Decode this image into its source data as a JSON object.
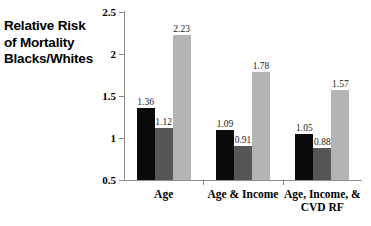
{
  "chart_data": {
    "type": "bar",
    "title": "",
    "ylabel": "Relative Risk of Mortality Blacks/Whites",
    "ylabel_lines": [
      "Relative Risk",
      "of Mortality",
      "Blacks/Whites"
    ],
    "xlabel": "",
    "categories": [
      "Age",
      "Age & Income",
      "Age, Income, & CVD RF"
    ],
    "category_lines": [
      [
        "Age"
      ],
      [
        "Age & Income"
      ],
      [
        "Age, Income, &",
        "CVD RF"
      ]
    ],
    "ylim": [
      0.5,
      2.5
    ],
    "yticks": [
      0.5,
      1,
      1.5,
      2,
      2.5
    ],
    "ytick_labels": [
      "0.5",
      "1",
      "1.5",
      "2",
      "2.5"
    ],
    "grid": false,
    "legend": "none",
    "series": [
      {
        "name": "series-1",
        "color": "#0a0a0a",
        "values": [
          1.36,
          1.09,
          1.05
        ],
        "labels": [
          "1.36",
          "1.09",
          "1.05"
        ]
      },
      {
        "name": "series-2",
        "color": "#565656",
        "values": [
          1.12,
          0.91,
          0.88
        ],
        "labels": [
          "1.12",
          "0.91",
          "0.88"
        ]
      },
      {
        "name": "series-3",
        "color": "#b4b4b4",
        "values": [
          2.23,
          1.78,
          1.57
        ],
        "labels": [
          "2.23",
          "1.78",
          "1.57"
        ]
      }
    ]
  }
}
